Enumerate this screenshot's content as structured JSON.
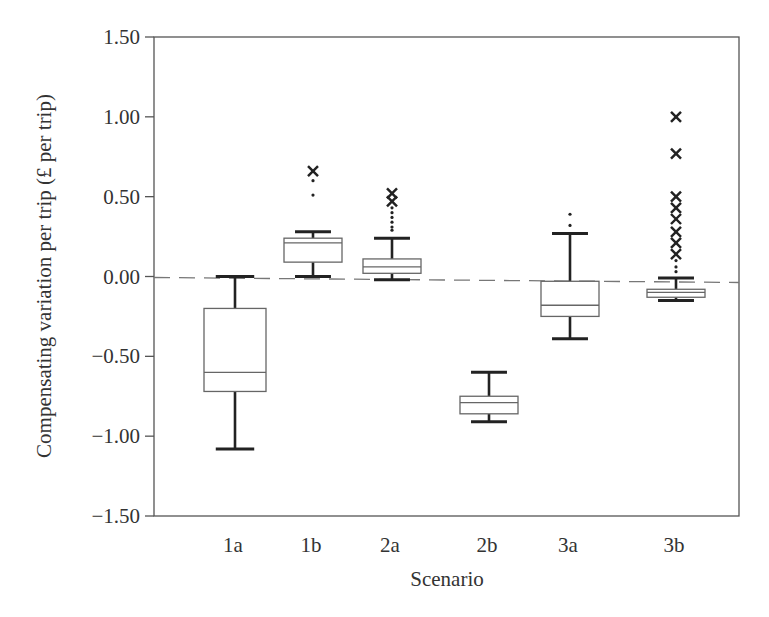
{
  "chart_data": {
    "type": "box",
    "title": "",
    "xlabel": "Scenario",
    "ylabel": "Compensating variation per trip (£ per trip)",
    "ylim": [
      -1.5,
      1.5
    ],
    "yticks": [
      1.5,
      1.0,
      0.5,
      0.0,
      -0.5,
      -1.0,
      -1.5
    ],
    "ytick_labels": [
      "1.50",
      "1.00",
      "0.50",
      "0.00",
      "−0.50",
      "−1.00",
      "−1.50"
    ],
    "categories": [
      "1a",
      "1b",
      "2a",
      "2b",
      "3a",
      "3b"
    ],
    "grid": false,
    "reference_line": {
      "y": 0.0,
      "style": "dashed"
    },
    "series": [
      {
        "name": "1a",
        "whisker_high": 0.0,
        "q3": -0.2,
        "median": -0.6,
        "q1": -0.72,
        "whisker_low": -1.08,
        "outliers_cross": [],
        "outliers_dot": []
      },
      {
        "name": "1b",
        "whisker_high": 0.28,
        "q3": 0.24,
        "median": 0.21,
        "q1": 0.09,
        "whisker_low": 0.0,
        "outliers_cross": [
          0.66
        ],
        "outliers_dot": [
          0.6,
          0.51
        ]
      },
      {
        "name": "2a",
        "whisker_high": 0.24,
        "q3": 0.11,
        "median": 0.06,
        "q1": 0.02,
        "whisker_low": -0.02,
        "outliers_cross": [
          0.52,
          0.47
        ],
        "outliers_dot": [
          0.43,
          0.4,
          0.37,
          0.34,
          0.31,
          0.29
        ]
      },
      {
        "name": "2b",
        "whisker_high": -0.6,
        "q3": -0.75,
        "median": -0.79,
        "q1": -0.86,
        "whisker_low": -0.91,
        "outliers_cross": [],
        "outliers_dot": []
      },
      {
        "name": "3a",
        "whisker_high": 0.27,
        "q3": -0.03,
        "median": -0.18,
        "q1": -0.25,
        "whisker_low": -0.39,
        "outliers_cross": [],
        "outliers_dot": [
          0.39,
          0.32
        ]
      },
      {
        "name": "3b",
        "whisker_high": -0.01,
        "q3": -0.08,
        "median": -0.1,
        "q1": -0.13,
        "whisker_low": -0.15,
        "outliers_cross": [
          1.0,
          0.77,
          0.5,
          0.43,
          0.36,
          0.28,
          0.21,
          0.14
        ],
        "outliers_dot": [
          0.1,
          0.06,
          0.03
        ]
      }
    ]
  },
  "colors": {
    "axis": "#555555",
    "box_line": "#666666",
    "whisker": "#222222",
    "marker": "#222222",
    "reference_line": "#777777"
  }
}
